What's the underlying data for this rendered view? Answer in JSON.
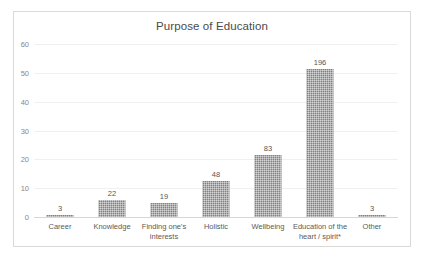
{
  "chart_data": {
    "type": "bar",
    "title": "Purpose of Education",
    "xlabel": "",
    "ylabel": "",
    "ylim": [
      0,
      60
    ],
    "yticks": [
      0,
      10,
      20,
      30,
      40,
      50,
      60
    ],
    "grid": true,
    "legend": false,
    "orientation": "vertical",
    "bar_color": "#808080",
    "categories": [
      "Career",
      "Knowledge",
      "Finding one's interests",
      "Holistic",
      "Wellbeing",
      "Education of the heart / spirit*",
      "Other"
    ],
    "data_labels": [
      "3",
      "22",
      "19",
      "48",
      "83",
      "196",
      "3"
    ],
    "counts": [
      3,
      22,
      19,
      48,
      83,
      196,
      3
    ],
    "values": [
      0.8,
      5.8,
      4.8,
      12.4,
      21.5,
      51.5,
      0.8
    ],
    "value_note": "Bar heights are percentages; printed data labels are raw counts."
  },
  "colors": {
    "frame_border": "#d9d9d9",
    "gridline": "#f0f0f0",
    "axis": "#d6d6d6",
    "title_text": "#4a4a4a",
    "tick_text": "#888888",
    "label_text": "#5a5a5a",
    "bar_fill": "#808080"
  }
}
